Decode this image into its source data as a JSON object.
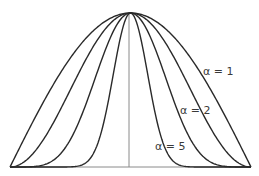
{
  "chart_data": {
    "type": "line",
    "title": "",
    "xlabel": "",
    "ylabel": "",
    "xlim": [
      -1,
      1
    ],
    "ylim": [
      0,
      1
    ],
    "grid": false,
    "function": "y = cos(pi*x/2)^alpha",
    "series": [
      {
        "name": "α = 1",
        "alpha": 1,
        "label": "α = 1"
      },
      {
        "name": "α = 2",
        "alpha": 2,
        "label": "α = 2"
      },
      {
        "name": "α = 5",
        "alpha": 5,
        "label": "α = 5"
      },
      {
        "name": "α = 20",
        "alpha": 20,
        "label": ""
      }
    ],
    "annotations": [
      "α = 1",
      "α = 2",
      "α = 5"
    ],
    "center_line_x": 0
  }
}
